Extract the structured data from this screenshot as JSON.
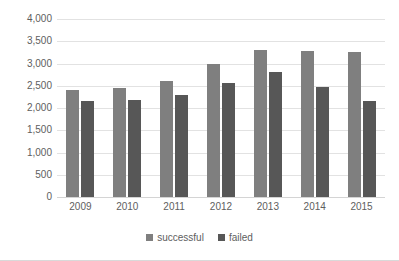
{
  "chart_data": {
    "type": "bar",
    "title": "",
    "subtitle": "",
    "xlabel": "",
    "ylabel": "",
    "categories": [
      "2009",
      "2010",
      "2011",
      "2012",
      "2013",
      "2014",
      "2015"
    ],
    "series": [
      {
        "name": "successful",
        "color": "#7f7f7f",
        "values": [
          2400,
          2440,
          2610,
          2980,
          3300,
          3290,
          3250
        ]
      },
      {
        "name": "failed",
        "color": "#575757",
        "values": [
          2160,
          2180,
          2290,
          2570,
          2810,
          2470,
          2150
        ]
      }
    ],
    "ylim": [
      0,
      4000
    ],
    "ytick_values": [
      0,
      500,
      1000,
      1500,
      2000,
      2500,
      3000,
      3500,
      4000
    ],
    "ytick_labels": [
      "0",
      "500",
      "1,000",
      "1,500",
      "2,000",
      "2,500",
      "3,000",
      "3,500",
      "4,000"
    ],
    "grid": true,
    "grid_axis": "y",
    "legend_position": "bottom",
    "legend_entries": [
      "successful",
      "failed"
    ],
    "background_color": "#ffffff",
    "grid_color": "#e2e2e2",
    "axis_text_color": "#5e5e5e"
  }
}
